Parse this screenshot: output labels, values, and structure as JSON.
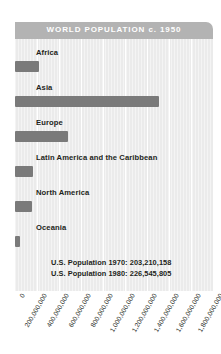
{
  "chart_data": {
    "type": "bar",
    "orientation": "horizontal",
    "title": "WORLD POPULATION c. 1950",
    "xlabel": "",
    "ylabel": "",
    "categories": [
      "Africa",
      "Asia",
      "Europe",
      "Latin America and the Caribbean",
      "North America",
      "Oceania"
    ],
    "values": [
      220000000,
      1310000000,
      480000000,
      165000000,
      150000000,
      45000000
    ],
    "xlim": [
      0,
      1800000000
    ],
    "xticks": [
      0,
      200000000,
      400000000,
      600000000,
      800000000,
      1000000000,
      1200000000,
      1400000000,
      1600000000,
      1800000000
    ],
    "xtick_labels": [
      "0",
      "200,000,000",
      "400,000,000",
      "600,000,000",
      "800,000,000",
      "1,000,000,000",
      "1,200,000,000",
      "1,400,000,000",
      "1,600,000,000",
      "1,800,000,000"
    ],
    "grid": true,
    "legend": false,
    "annotations": [
      "U.S. Population 1970: 203,210,158",
      "U.S. Population 1980: 226,545,805"
    ],
    "colors": {
      "bar": "#7a7a7a",
      "title_bar": "#b3b3b3",
      "title_text": "#ffffff",
      "plot_background": "#ebebeb",
      "gridline": "#ffffff",
      "label_text": "#231f20"
    }
  }
}
